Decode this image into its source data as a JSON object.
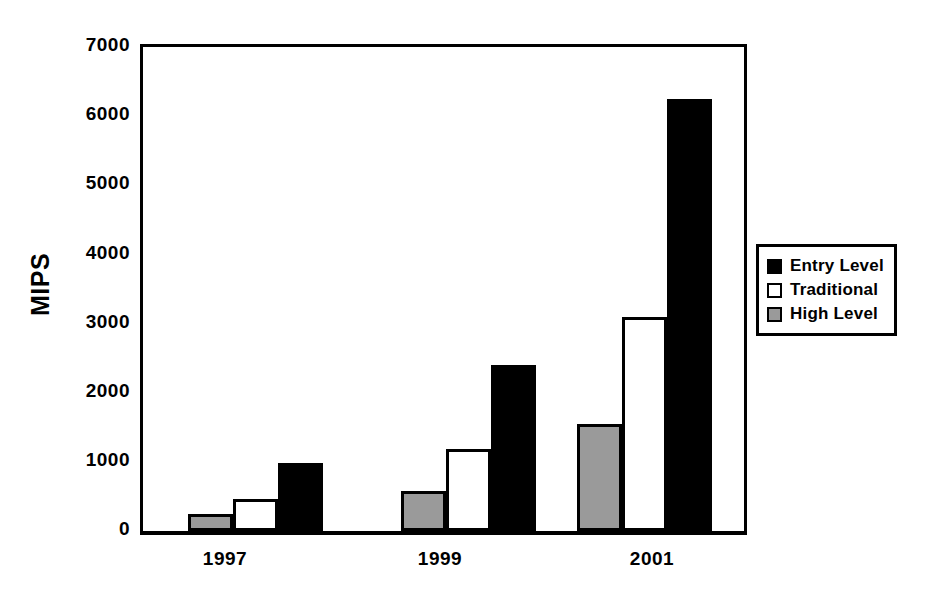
{
  "chart_data": {
    "type": "bar",
    "title": "",
    "xlabel": "",
    "ylabel": "MIPS",
    "categories": [
      "1997",
      "1999",
      "2001"
    ],
    "series": [
      {
        "name": "High Level",
        "color": "#9a9a9a",
        "values": [
          250,
          580,
          1550
        ]
      },
      {
        "name": "Traditional",
        "color": "#ffffff",
        "values": [
          470,
          1190,
          3100
        ]
      },
      {
        "name": "Entry Level",
        "color": "#000000",
        "values": [
          980,
          2400,
          6250
        ]
      }
    ],
    "ylim": [
      0,
      7000
    ],
    "yticks": [
      0,
      1000,
      2000,
      3000,
      4000,
      5000,
      6000,
      7000
    ],
    "ytick_labels": [
      "0",
      "1000",
      "2000",
      "3000",
      "4000",
      "5000",
      "6000",
      "7000"
    ],
    "grid": false,
    "legend_position": "right",
    "bar_order_in_group": [
      "High Level",
      "Traditional",
      "Entry Level"
    ]
  },
  "axis": {
    "y_title": "MIPS",
    "y_labels": [
      "7000",
      "6000",
      "5000",
      "4000",
      "3000",
      "2000",
      "1000",
      "0"
    ],
    "x_labels": [
      "1997",
      "1999",
      "2001"
    ]
  },
  "legend": {
    "items": [
      {
        "label": "Entry Level",
        "swatch": "black-swatch-icon"
      },
      {
        "label": "Traditional",
        "swatch": "white-swatch-icon"
      },
      {
        "label": "High Level",
        "swatch": "gray-swatch-icon"
      }
    ]
  },
  "colors": {
    "entry_level": "#000000",
    "traditional": "#ffffff",
    "high_level": "#9a9a9a",
    "axis": "#000000",
    "background": "#ffffff"
  }
}
